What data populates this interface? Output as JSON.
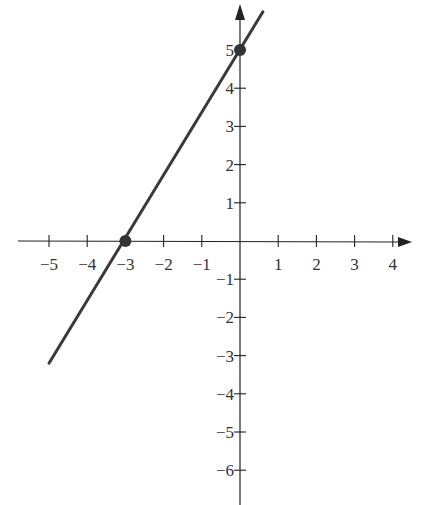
{
  "chart_data": {
    "type": "line",
    "title": "",
    "xlabel": "",
    "ylabel": "",
    "equation": "y = (5/3)x + 5",
    "xlim": [
      -5.5,
      4.5
    ],
    "ylim": [
      -6.7,
      6.0
    ],
    "x_ticks": [
      -5,
      -4,
      -3,
      -2,
      -1,
      1,
      2,
      3,
      4
    ],
    "y_ticks": [
      5,
      4,
      3,
      2,
      1,
      -1,
      -2,
      -3,
      -4,
      -5,
      -6
    ],
    "x_tick_labels": [
      "−5",
      "−4",
      "−3",
      "−2",
      "−1",
      "1",
      "2",
      "3",
      "4"
    ],
    "y_tick_labels": [
      "5",
      "4",
      "3",
      "2",
      "1",
      "−1",
      "−2",
      "−3",
      "−4",
      "−5",
      "−6"
    ],
    "grid": false,
    "legend": null,
    "series": [
      {
        "name": "line",
        "x": [
          -5.0,
          0.6
        ],
        "y": [
          -3.2,
          6.0
        ],
        "color": "#333333"
      }
    ],
    "points": [
      {
        "label": "x-intercept",
        "x": -3,
        "y": 0
      },
      {
        "label": "y-intercept",
        "x": 0,
        "y": 5
      }
    ]
  },
  "style": {
    "axis_color": "#222222",
    "line_color": "#3a3a3a",
    "point_color": "#333333"
  }
}
